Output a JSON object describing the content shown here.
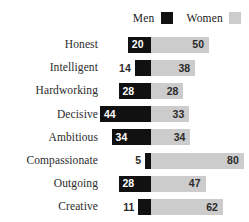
{
  "legend": {
    "entries": [
      {
        "label": "Men",
        "swatch": "men-swatch",
        "color": "#111111"
      },
      {
        "label": "Women",
        "swatch": "women-swatch",
        "color": "#cccccc"
      }
    ]
  },
  "chart_data": {
    "type": "bar",
    "subtype": "diverging-stacked-bar",
    "title": "",
    "xlabel": "",
    "ylabel": "",
    "grid": false,
    "legend_position": "top-right",
    "categories": [
      "Honest",
      "Intelligent",
      "Hardworking",
      "Decisive",
      "Ambitious",
      "Compassionate",
      "Outgoing",
      "Creative"
    ],
    "series": [
      {
        "name": "Men",
        "color": "#111111",
        "direction": "left",
        "values": [
          20,
          14,
          28,
          44,
          34,
          5,
          28,
          11
        ]
      },
      {
        "name": "Women",
        "color": "#cccccc",
        "direction": "right",
        "values": [
          50,
          38,
          28,
          33,
          34,
          80,
          47,
          62
        ]
      }
    ],
    "xlim": [
      -50,
      85
    ],
    "units_per_pixel": 0.86
  }
}
